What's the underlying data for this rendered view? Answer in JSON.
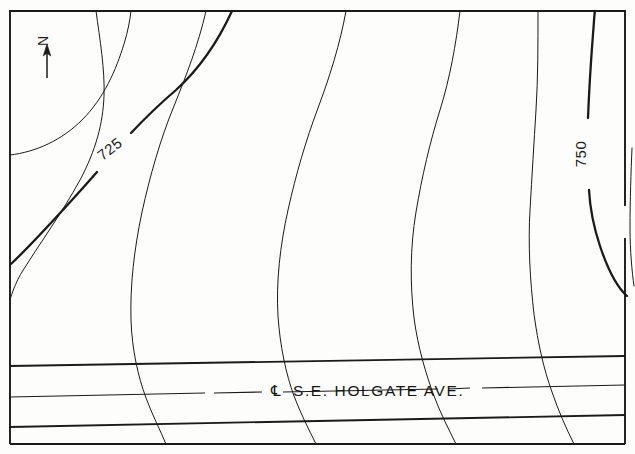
{
  "figure": {
    "kind": "topographic-contour-map",
    "width": 635,
    "height": 454,
    "background_color": "#fdfdfc",
    "line_color": "#1a1a1a"
  },
  "north_arrow": {
    "label": "N",
    "name": "north-arrow"
  },
  "contour_labels": [
    {
      "id": "c725",
      "text": "725",
      "elevation": 725,
      "x": 110,
      "y": 148,
      "rotation": -38,
      "weight": "index"
    },
    {
      "id": "c750",
      "text": "750",
      "elevation": 750,
      "x": 584,
      "y": 148,
      "rotation": -90,
      "weight": "index"
    }
  ],
  "street": {
    "name_text": "S.E. HOLGATE AVE.",
    "centerline_symbol": "℄",
    "centerline_style": "dashed"
  },
  "chart_data": {
    "type": "line",
    "title": "",
    "xlabel": "",
    "ylabel": "",
    "contour_interval": 5,
    "labeled_contours": [
      725,
      750
    ],
    "index_contours": [
      725,
      750
    ],
    "contour_count_at_top_border": 7,
    "series": [
      {
        "name": "contour-701",
        "elevation": null,
        "weight": "intermediate",
        "path": "M 10,300 C 10,300 14,285 22,272 C 40,243 62,213 80,180 C 96,150 103,123 104,96 C 105,70 100,40 96,11"
      },
      {
        "name": "contour-725",
        "elevation": 725,
        "weight": "index",
        "path": "M 11,264 C 40,235 70,200 96,168 C 120,138 142,116 164,98 C 190,76 214,52 232,11"
      },
      {
        "name": "contour-730",
        "elevation": null,
        "weight": "intermediate",
        "path": "M 10,155 C 36,152 62,140 82,120 C 104,98 116,70 124,44 C 128,31 130,20 131,11"
      },
      {
        "name": "contour-735",
        "elevation": null,
        "weight": "intermediate",
        "path": "M 166,444 C 160,430 152,414 146,398 C 138,376 132,350 131,320 C 130,286 134,250 142,212 C 150,176 160,140 174,106 C 186,76 198,46 206,11"
      },
      {
        "name": "contour-740",
        "elevation": null,
        "weight": "intermediate",
        "path": "M 316,444 C 308,428 300,412 294,396 C 286,374 280,346 278,316 C 276,282 280,246 288,210 C 296,174 306,140 318,108 C 330,76 340,44 346,11"
      },
      {
        "name": "contour-745",
        "elevation": null,
        "weight": "intermediate",
        "path": "M 456,444 C 448,428 440,412 434,396 C 426,374 418,348 414,318 C 410,284 410,248 416,212 C 422,176 430,142 440,110 C 450,78 456,44 460,11"
      },
      {
        "name": "contour-748",
        "elevation": null,
        "weight": "intermediate",
        "path": "M 574,444 C 566,428 558,410 552,392 C 544,370 538,344 534,314 C 530,280 528,244 530,210 C 532,176 534,142 536,110 C 538,78 538,44 538,11"
      },
      {
        "name": "contour-750",
        "elevation": 750,
        "weight": "index",
        "path": "M 627,296 C 618,288 608,270 600,246 C 592,218 588,186 588,154 C 588,118 590,80 592,48 C 593,32 594,20 595,11"
      },
      {
        "name": "contour-755",
        "elevation": null,
        "weight": "intermediate",
        "path": "M 634,286 C 632,272 630,250 630,228 C 630,200 631,172 632,148"
      }
    ],
    "street_lines": [
      {
        "name": "street-top-curb",
        "y_left": 366,
        "y_right": 356
      },
      {
        "name": "street-centerline",
        "y_left": 397,
        "y_right": 385,
        "style": "dashed"
      },
      {
        "name": "street-bottom-curb",
        "y_left": 427,
        "y_right": 415
      }
    ]
  }
}
